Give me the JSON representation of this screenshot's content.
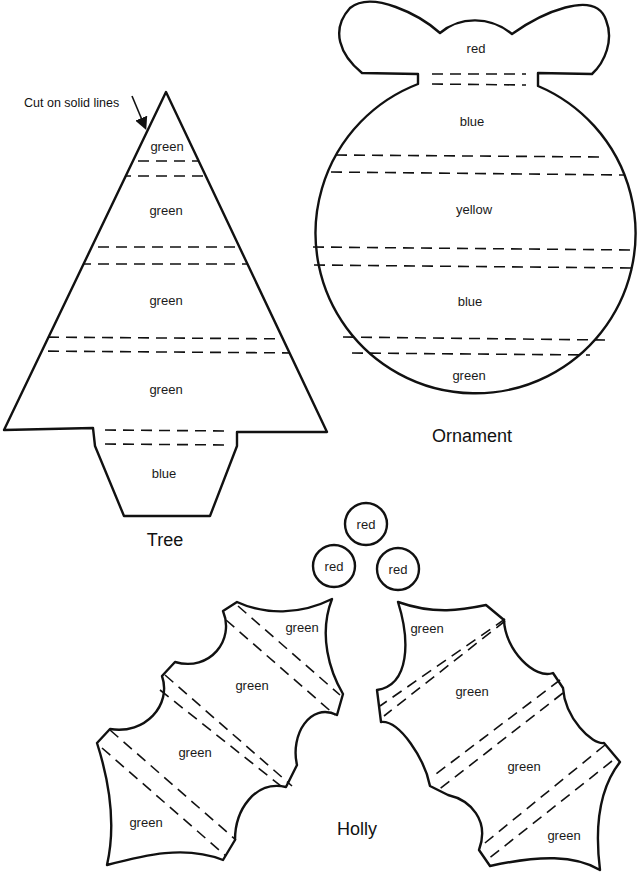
{
  "instruction": {
    "text": "Cut on solid lines"
  },
  "tree": {
    "title": "Tree",
    "sections": [
      {
        "label": "green"
      },
      {
        "label": "green"
      },
      {
        "label": "green"
      },
      {
        "label": "green"
      },
      {
        "label": "blue"
      }
    ]
  },
  "ornament": {
    "title": "Ornament",
    "sections": [
      {
        "label": "red"
      },
      {
        "label": "blue"
      },
      {
        "label": "yellow"
      },
      {
        "label": "blue"
      },
      {
        "label": "green"
      }
    ]
  },
  "berries": [
    {
      "label": "red"
    },
    {
      "label": "red"
    },
    {
      "label": "red"
    }
  ],
  "holly": {
    "title": "Holly",
    "left_leaf": [
      {
        "label": "green"
      },
      {
        "label": "green"
      },
      {
        "label": "green"
      },
      {
        "label": "green"
      }
    ],
    "right_leaf": [
      {
        "label": "green"
      },
      {
        "label": "green"
      },
      {
        "label": "green"
      },
      {
        "label": "green"
      }
    ]
  },
  "colors": {
    "line": "#111111",
    "background": "#ffffff"
  }
}
